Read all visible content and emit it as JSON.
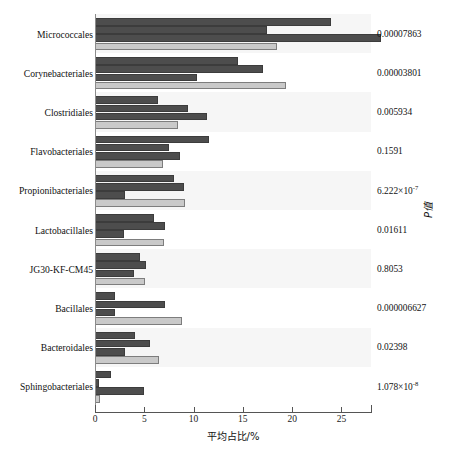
{
  "chart_data": {
    "type": "bar",
    "orientation": "horizontal",
    "title": "",
    "xlabel": "平均占比/%",
    "ylabel": "",
    "right_axis_label": "P值",
    "xlim": [
      0,
      28
    ],
    "grid": false,
    "legend_position": "none",
    "xticks": [
      0,
      5,
      10,
      15,
      20,
      25
    ],
    "xtick_labels": [
      "0",
      "5",
      "10",
      "15",
      "20",
      "25"
    ],
    "categories": [
      "Micrococcales",
      "Corynebacteriales",
      "Clostridiales",
      "Flavobacteriales",
      "Propionibacteriales",
      "Lactobacillales",
      "JG30-KF-CM45",
      "Bacillales",
      "Bacteroidales",
      "Sphingobacteriales"
    ],
    "series": [
      {
        "name": "series-1",
        "color": "#4d4d4d",
        "values": [
          23.9,
          14.5,
          6.4,
          11.6,
          8.0,
          6.0,
          4.6,
          2.0,
          4.1,
          1.6
        ]
      },
      {
        "name": "series-2",
        "color": "#4d4d4d",
        "values": [
          17.4,
          17.0,
          9.4,
          7.5,
          9.0,
          7.1,
          5.2,
          7.1,
          5.6,
          0.4
        ]
      },
      {
        "name": "series-3",
        "color": "#4d4d4d",
        "values": [
          29.0,
          10.3,
          11.4,
          8.6,
          3.0,
          2.9,
          4.0,
          2.0,
          3.0,
          5.0
        ]
      },
      {
        "name": "series-4",
        "color": "#c9c9c9",
        "values": [
          18.5,
          19.4,
          8.4,
          6.9,
          9.1,
          7.0,
          5.1,
          8.8,
          6.5,
          0.5
        ]
      }
    ],
    "p_values": [
      "0.00007863",
      "0.00003801",
      "0.005934",
      "0.1591",
      "6.222×10",
      "0.01611",
      "0.8053",
      "0.000006627",
      "0.02398",
      "1.078×10"
    ],
    "p_value_exponents": [
      "",
      "",
      "",
      "",
      "-7",
      "",
      "",
      "",
      "",
      "-8"
    ]
  },
  "colors": {
    "bar_dark": "#4d4d4d",
    "bar_light": "#c9c9c9",
    "band_alt": "#f6f6f6",
    "band_plain": "#ffffff",
    "axis": "#555555",
    "text": "#111111"
  }
}
